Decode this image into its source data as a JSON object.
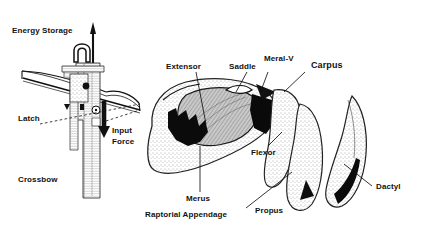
{
  "figure": {
    "background_color": "#ffffff",
    "ink_color": "#111111",
    "panels": [
      {
        "name": "crossbow-panel",
        "caption": "Crossbow"
      },
      {
        "name": "raptorial-appendage-panel",
        "caption": "Raptorial Appendage"
      }
    ]
  },
  "labels": {
    "energy_storage": "Energy Storage",
    "latch": "Latch",
    "input_force_line1": "Input",
    "input_force_line2": "Force",
    "crossbow": "Crossbow",
    "extensor": "Extensor",
    "saddle": "Saddle",
    "meral_v": "Meral-V",
    "carpus": "Carpus",
    "flexor": "Flexor",
    "merus": "Merus",
    "raptorial_appendage": "Raptorial Appendage",
    "propus": "Propus",
    "dactyl": "Dactyl"
  },
  "arrows": {
    "stored_energy_arrow": "up-arrow-crossbow-bolt",
    "input_force_arrow": "down-arrow-thick"
  },
  "leaders": {
    "latch": "dashed",
    "input_force": "dashed",
    "extensor": "solid",
    "saddle": "solid",
    "meral_v": "solid",
    "carpus": "solid",
    "flexor": "solid",
    "merus": "solid",
    "propus": "solid",
    "dactyl": "solid"
  }
}
